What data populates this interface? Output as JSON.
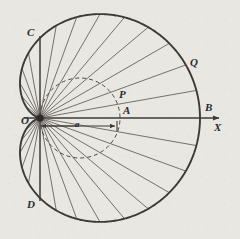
{
  "figure": {
    "background_color": "#e9e7e2",
    "ink_color": "#3c3a38",
    "labels": {
      "origin": "O",
      "axis": "X",
      "point_b": "B",
      "point_c": "C",
      "point_d": "D",
      "point_q": "Q",
      "point_p": "P",
      "point_a_upper": "A",
      "segment_a": "a"
    }
  },
  "chart_data": {
    "type": "line",
    "xlabel": "X",
    "ylabel": "",
    "curves": [
      {
        "name": "cardioid",
        "equation": "r = a(1 + cos(theta))",
        "parameter_a": 80,
        "style": "solid",
        "cusp": {
          "label": "O",
          "x": 0,
          "y": 0
        },
        "points_of_interest": [
          {
            "label": "O",
            "x": 0,
            "y": 0,
            "note": "cusp at origin, pole"
          },
          {
            "label": "B",
            "x": 160,
            "y": 0,
            "note": "r = 2a at theta = 0"
          },
          {
            "label": "C",
            "x": 0,
            "y": 80,
            "note": "r = a at theta = 90 deg"
          },
          {
            "label": "D",
            "x": 0,
            "y": -80,
            "note": "r = a at theta = -90 deg"
          },
          {
            "label": "Q",
            "x": 129,
            "y": 71,
            "note": "point on cardioid"
          },
          {
            "label": "P",
            "x": 78,
            "y": 38,
            "note": "point on generating circle"
          },
          {
            "label": "A",
            "x": 79,
            "y": 0,
            "note": "r = a on the axis"
          }
        ]
      },
      {
        "name": "generating-circle",
        "equation": "r = a cos(theta)",
        "style": "dashed",
        "center": {
          "x": 40,
          "y": 0
        },
        "radius": 40,
        "note": "circle of diameter a through the pole O"
      },
      {
        "name": "vertical-chord-CD",
        "style": "solid",
        "from": {
          "x": 0,
          "y": 80
        },
        "to": {
          "x": 0,
          "y": -80
        }
      },
      {
        "name": "axis-OX",
        "style": "solid-arrow",
        "from": {
          "x": 0,
          "y": 0
        },
        "to": {
          "x": 182,
          "y": 0
        }
      },
      {
        "name": "segment-a-dimension",
        "style": "double-arrow",
        "from": {
          "x": 0,
          "y": -8
        },
        "to": {
          "x": 79,
          "y": -8
        },
        "label": "a"
      }
    ],
    "radial_chords": {
      "count": 35,
      "angle_step_deg": 10,
      "angle_range_deg": [
        -170,
        170
      ],
      "note": "focal chords drawn from the cusp O to the cardioid"
    },
    "axis_ranges": {
      "theta_deg": [
        -180,
        180
      ],
      "r": [
        0,
        160
      ]
    },
    "grid": false,
    "legend": false
  }
}
